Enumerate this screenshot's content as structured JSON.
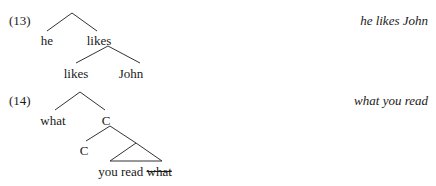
{
  "examples": [
    {
      "number": "(13)",
      "gloss": "he likes John",
      "tree": {
        "root": "",
        "children": [
          {
            "label": "he"
          },
          {
            "label": "likes",
            "children": [
              {
                "label": "likes"
              },
              {
                "label": "John"
              }
            ]
          }
        ]
      },
      "nodes": {
        "he": "he",
        "likes_mid": "likes",
        "likes_leaf": "likes",
        "john": "John"
      }
    },
    {
      "number": "(14)",
      "gloss": "what you read",
      "tree": {
        "root": "",
        "children": [
          {
            "label": "what"
          },
          {
            "label": "C",
            "children": [
              {
                "label": "C"
              },
              {
                "label": "you read what",
                "triangle": true,
                "struck": "what"
              }
            ]
          }
        ]
      },
      "nodes": {
        "what": "what",
        "c_mid": "C",
        "c_leaf": "C",
        "yield_plain": "you read",
        "yield_struck": "what"
      }
    }
  ]
}
